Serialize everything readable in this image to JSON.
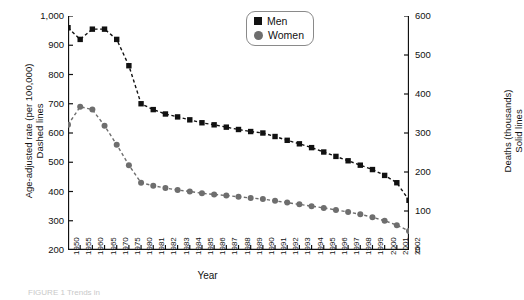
{
  "axis_titles": {
    "left_line1": "Age-adjusted rate (per 100,000)",
    "left_line2": "Dashed lines",
    "right_line1": "Deaths (thousands)",
    "right_line2": "Solid lines",
    "x": "Year"
  },
  "legend": {
    "men_label": "Men",
    "men_marker": "square-marker-black",
    "women_label": "Women",
    "women_marker": "circle-marker-gray"
  },
  "caption": "FIGURE 1 Trends in",
  "colors": {
    "men": "#111111",
    "women": "#6e6e6e",
    "axis": "#111111"
  },
  "chart_data": {
    "type": "line",
    "title": "",
    "xlabel": "Year",
    "ylabel": "Age-adjusted rate (per 100,000) Dashed lines",
    "y2label": "Deaths (thousands) Solid lines",
    "ylim": [
      200,
      1000
    ],
    "y2lim": [
      0,
      600
    ],
    "yticks": [
      200,
      300,
      400,
      500,
      600,
      700,
      800,
      900,
      1000
    ],
    "ytick_labels": [
      "200",
      "300",
      "400",
      "500",
      "600",
      "700",
      "800",
      "900",
      "1,000"
    ],
    "y2ticks": [
      0,
      100,
      200,
      300,
      400,
      500,
      600
    ],
    "y2tick_labels": [
      "0",
      "100",
      "200",
      "300",
      "400",
      "500",
      "600"
    ],
    "grid": false,
    "legend_position": "top-right",
    "x": [
      1950,
      1955,
      1960,
      1965,
      1970,
      1975,
      1980,
      1981,
      1982,
      1983,
      1984,
      1985,
      1986,
      1987,
      1988,
      1989,
      1990,
      1991,
      1992,
      1993,
      1994,
      1995,
      1996,
      1997,
      1998,
      1999,
      2000,
      2001,
      2002
    ],
    "xtick_labels": [
      "1950",
      "1955",
      "1960",
      "1965",
      "1970",
      "1975",
      "1980",
      "1981",
      "1982",
      "1983",
      "1984",
      "1985",
      "1986",
      "1987",
      "1988",
      "1989",
      "1990",
      "1991",
      "1992",
      "1993",
      "1994",
      "1995",
      "1996",
      "1997",
      "1998",
      "1999",
      "2000",
      "2001",
      "2002"
    ],
    "series": [
      {
        "name": "Men",
        "style": "dashed",
        "axis": "left",
        "unit": "rate per 100,000",
        "marker": "square",
        "color": "#111111",
        "values": [
          960,
          920,
          955,
          955,
          920,
          830,
          700,
          680,
          665,
          655,
          645,
          635,
          628,
          620,
          612,
          605,
          600,
          588,
          575,
          563,
          550,
          535,
          520,
          505,
          490,
          475,
          455,
          430,
          370
        ]
      },
      {
        "name": "Women",
        "style": "dashed",
        "axis": "left",
        "unit": "rate per 100,000",
        "marker": "circle",
        "color": "#6e6e6e",
        "values": [
          628,
          690,
          680,
          625,
          560,
          490,
          430,
          420,
          412,
          405,
          400,
          394,
          390,
          386,
          382,
          378,
          374,
          368,
          362,
          356,
          350,
          344,
          337,
          330,
          322,
          312,
          300,
          285,
          265
        ]
      },
      {
        "name": "Men",
        "style": "solid",
        "axis": "right",
        "unit": "deaths (thousands)",
        "marker": "square",
        "color": "#111111",
        "values": [
          755,
          805,
          885,
          925,
          920,
          885,
          858,
          845,
          840,
          838,
          837,
          836,
          838,
          838,
          840,
          838,
          836,
          835,
          833,
          838,
          835,
          833,
          832,
          828,
          822,
          814,
          812,
          810,
          772
        ]
      },
      {
        "name": "Women",
        "style": "solid",
        "axis": "right",
        "unit": "deaths (thousands)",
        "marker": "circle",
        "color": "#6e6e6e",
        "values": [
          628,
          700,
          745,
          785,
          812,
          822,
          828,
          828,
          826,
          825,
          827,
          826,
          830,
          832,
          836,
          836,
          838,
          838,
          836,
          840,
          841,
          840,
          844,
          845,
          848,
          852,
          848,
          845,
          843
        ]
      }
    ]
  }
}
